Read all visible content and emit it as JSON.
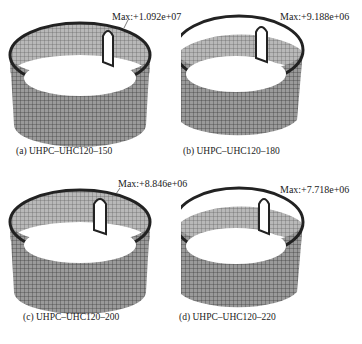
{
  "figure": {
    "top_cut_text": "",
    "panels": [
      {
        "id": "a",
        "caption": "(a) UHPC–UHC120–150",
        "max_label": "Max:+1.092e+07"
      },
      {
        "id": "b",
        "caption": "(b) UHPC–UHC120–180",
        "max_label": "Max:+9.188e+06"
      },
      {
        "id": "c",
        "caption": "(c) UHPC–UHC120–200",
        "max_label": "Max:+8.846e+06"
      },
      {
        "id": "d",
        "caption": "(d) UHPC–UHC120–220",
        "max_label": "Max:+7.718e+06"
      }
    ]
  }
}
